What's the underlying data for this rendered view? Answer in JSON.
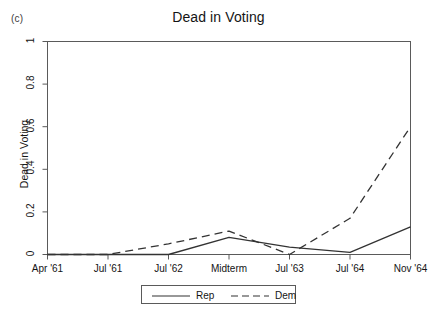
{
  "panel_label": "(c)",
  "chart_data": {
    "type": "line",
    "title": "Dead in Voting",
    "xlabel": "",
    "ylabel": "Dead in Voting",
    "categories": [
      "Apr '61",
      "Jul '61",
      "Jul '62",
      "Midterm",
      "Jul '63",
      "Jul '64",
      "Nov '64"
    ],
    "yticks": [
      0,
      0.2,
      0.4,
      0.6,
      0.8,
      1
    ],
    "ytick_labels": [
      "0",
      "0.2",
      "0.4",
      "0.6",
      "0.8",
      "1"
    ],
    "ylim": [
      0,
      1
    ],
    "grid": false,
    "legend_position": "below-center",
    "series": [
      {
        "name": "Rep",
        "style": "solid",
        "color": "#333333",
        "values": [
          0,
          0,
          0,
          0.08,
          0.035,
          0.01,
          0.13
        ]
      },
      {
        "name": "Dem",
        "style": "dashed",
        "color": "#333333",
        "values": [
          0,
          0,
          0.05,
          0.11,
          0,
          0.17,
          0.6
        ]
      }
    ]
  },
  "legend": {
    "items": [
      {
        "label": "Rep",
        "style": "solid"
      },
      {
        "label": "Dem",
        "style": "dashed"
      }
    ]
  }
}
